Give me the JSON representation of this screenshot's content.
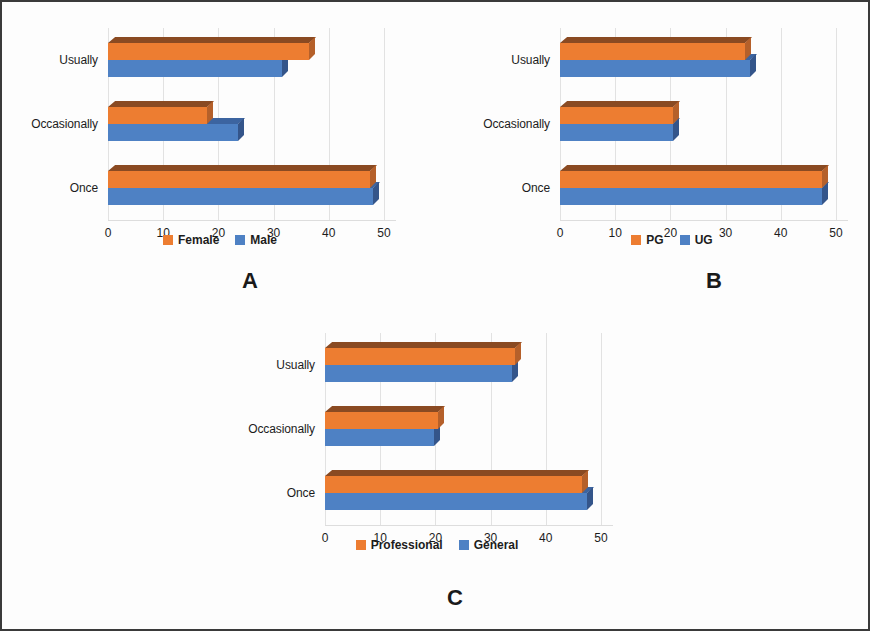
{
  "figure": {
    "background_color": "#fdfdfd",
    "border_color": "#3a3a3a",
    "orange_color": "#ED7D31",
    "blue_color": "#4E81C4"
  },
  "chart_data": [
    {
      "type": "bar",
      "orientation": "horizontal",
      "panel": "A",
      "title": "",
      "xlabel": "",
      "ylabel": "",
      "categories": [
        "Once",
        "Occasionally",
        "Usually"
      ],
      "series": [
        {
          "name": "Female",
          "color": "#ED7D31",
          "values": [
            47.5,
            18,
            36.5
          ]
        },
        {
          "name": "Male",
          "color": "#4E81C4",
          "values": [
            48,
            23.5,
            31.5
          ]
        }
      ],
      "xticks": [
        0,
        10,
        20,
        30,
        40,
        50
      ],
      "xlim": [
        0,
        50
      ],
      "grid": true,
      "legend_position": "bottom",
      "legend": [
        "Female",
        "Male"
      ]
    },
    {
      "type": "bar",
      "orientation": "horizontal",
      "panel": "B",
      "title": "",
      "xlabel": "",
      "ylabel": "",
      "categories": [
        "Once",
        "Occasionally",
        "Usually"
      ],
      "series": [
        {
          "name": "PG",
          "color": "#ED7D31",
          "values": [
            47.5,
            20.5,
            33.5
          ]
        },
        {
          "name": "UG",
          "color": "#4E81C4",
          "values": [
            47.5,
            20.5,
            34.5
          ]
        }
      ],
      "xticks": [
        0,
        10,
        20,
        30,
        40,
        50
      ],
      "xlim": [
        0,
        50
      ],
      "grid": true,
      "legend_position": "bottom",
      "legend": [
        "PG",
        "UG"
      ]
    },
    {
      "type": "bar",
      "orientation": "horizontal",
      "panel": "C",
      "title": "",
      "xlabel": "",
      "ylabel": "",
      "categories": [
        "Once",
        "Occasionally",
        "Usually"
      ],
      "series": [
        {
          "name": "Professional",
          "color": "#ED7D31",
          "values": [
            46.5,
            20.5,
            34.5
          ]
        },
        {
          "name": "General",
          "color": "#4E81C4",
          "values": [
            47.5,
            19.8,
            33.8
          ]
        }
      ],
      "xticks": [
        0,
        10,
        20,
        30,
        40,
        50
      ],
      "xlim": [
        0,
        50
      ],
      "grid": true,
      "legend_position": "bottom",
      "legend": [
        "Professional",
        "General"
      ]
    }
  ],
  "panels": [
    {
      "letter": "A",
      "categories": [
        "Once",
        "Occasionally",
        "Usually"
      ],
      "ticks": [
        "0",
        "10",
        "20",
        "30",
        "40",
        "50"
      ],
      "legend": [
        {
          "label": "Female",
          "color": "#ED7D31"
        },
        {
          "label": "Male",
          "color": "#4E81C4"
        }
      ]
    },
    {
      "letter": "B",
      "categories": [
        "Once",
        "Occasionally",
        "Usually"
      ],
      "ticks": [
        "0",
        "10",
        "20",
        "30",
        "40",
        "50"
      ],
      "legend": [
        {
          "label": "PG",
          "color": "#ED7D31"
        },
        {
          "label": "UG",
          "color": "#4E81C4"
        }
      ]
    },
    {
      "letter": "C",
      "categories": [
        "Once",
        "Occasionally",
        "Usually"
      ],
      "ticks": [
        "0",
        "10",
        "20",
        "30",
        "40",
        "50"
      ],
      "legend": [
        {
          "label": "Professional",
          "color": "#ED7D31"
        },
        {
          "label": "General",
          "color": "#4E81C4"
        }
      ]
    }
  ]
}
